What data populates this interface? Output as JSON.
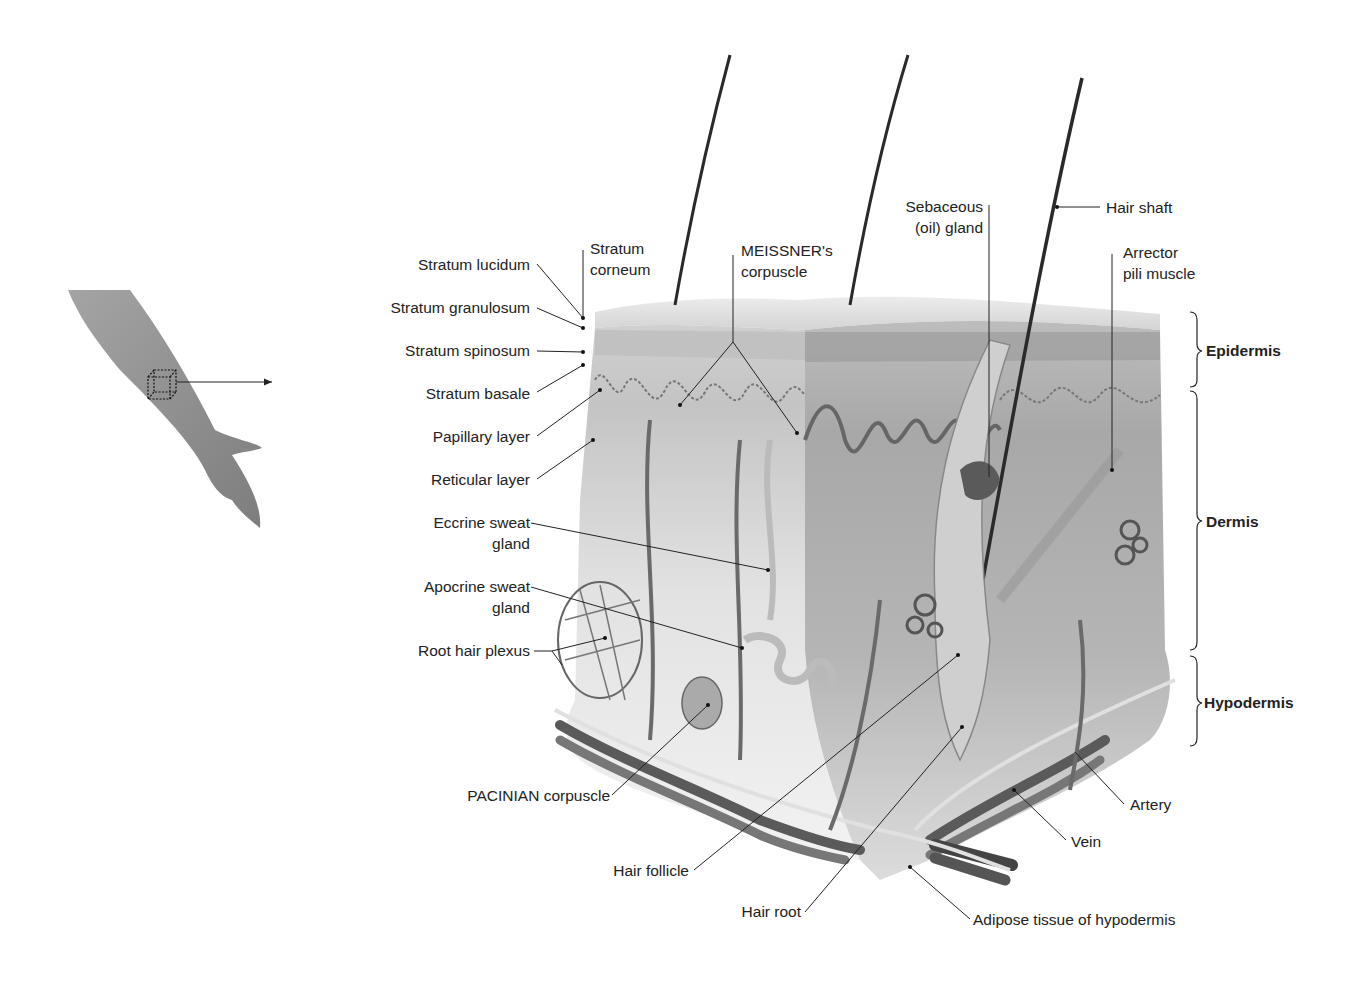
{
  "figure": {
    "regions": {
      "epidermis": "Epidermis",
      "dermis": "Dermis",
      "hypodermis": "Hypodermis"
    },
    "labels_left": {
      "stratum_lucidum": "Stratum lucidum",
      "stratum_granulosum": "Stratum granulosum",
      "stratum_spinosum": "Stratum spinosum",
      "stratum_basale": "Stratum basale",
      "papillary_layer": "Papillary layer",
      "reticular_layer": "Reticular layer",
      "eccrine_1": "Eccrine sweat",
      "eccrine_2": "gland",
      "apocrine_1": "Apocrine sweat",
      "apocrine_2": "gland",
      "root_hair_plexus": "Root hair plexus"
    },
    "labels_top": {
      "stratum_corneum_1": "Stratum",
      "stratum_corneum_2": "corneum",
      "meissner_1": "MEISSNER's",
      "meissner_2": "corpuscle",
      "sebaceous_1": "Sebaceous",
      "sebaceous_2": "(oil) gland",
      "hair_shaft": "Hair shaft",
      "arrector_1": "Arrector",
      "arrector_2": "pili muscle"
    },
    "labels_bottom": {
      "pacinian": "PACINIAN corpuscle",
      "hair_follicle": "Hair follicle",
      "hair_root": "Hair root",
      "adipose": "Adipose tissue of hypodermis",
      "vein": "Vein",
      "artery": "Artery"
    },
    "inset": {
      "description": "Forearm with cube marking sampled skin region",
      "arrow": "pointer-arrow"
    }
  }
}
